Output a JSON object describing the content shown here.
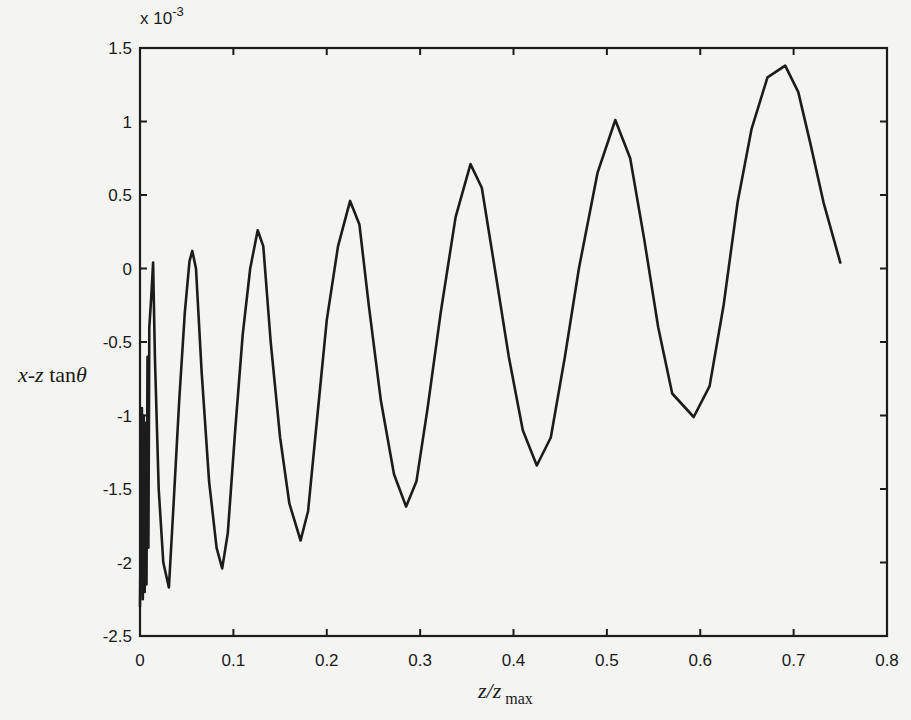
{
  "chart_data": {
    "type": "line",
    "title": "",
    "xlabel": "z/z max",
    "xlabel_parts": {
      "main": "z/z",
      "sub": "max"
    },
    "ylabel": "x-z tanθ",
    "ylabel_parts": {
      "italic": "x-z",
      "roman": " tan",
      "theta": "θ"
    },
    "y_multiplier": "x 10",
    "y_multiplier_exp": "-3",
    "xlim": [
      0,
      0.8
    ],
    "ylim": [
      -2.5,
      1.5
    ],
    "xticks": [
      "0",
      "0.1",
      "0.2",
      "0.3",
      "0.4",
      "0.5",
      "0.6",
      "0.7",
      "0.8"
    ],
    "xtick_values": [
      0,
      0.1,
      0.2,
      0.3,
      0.4,
      0.5,
      0.6,
      0.7,
      0.8
    ],
    "yticks": [
      "1.5",
      "1",
      "0.5",
      "0",
      "-0.5",
      "-1",
      "-1.5",
      "-2",
      "-2.5"
    ],
    "ytick_values": [
      1.5,
      1,
      0.5,
      0,
      -0.5,
      -1,
      -1.5,
      -2,
      -2.5
    ],
    "grid": false,
    "legend": "none",
    "line_color": "#1c1c1c",
    "series": [
      {
        "name": "x-z tanθ",
        "x": [
          0.0,
          0.002,
          0.003,
          0.004,
          0.005,
          0.006,
          0.007,
          0.008,
          0.009,
          0.01,
          0.012,
          0.014,
          0.016,
          0.02,
          0.025,
          0.031,
          0.036,
          0.042,
          0.048,
          0.053,
          0.056,
          0.06,
          0.066,
          0.074,
          0.082,
          0.088,
          0.094,
          0.102,
          0.11,
          0.118,
          0.126,
          0.132,
          0.14,
          0.15,
          0.16,
          0.172,
          0.18,
          0.19,
          0.2,
          0.212,
          0.225,
          0.235,
          0.245,
          0.258,
          0.272,
          0.285,
          0.296,
          0.308,
          0.322,
          0.338,
          0.354,
          0.366,
          0.38,
          0.395,
          0.41,
          0.425,
          0.44,
          0.455,
          0.47,
          0.49,
          0.509,
          0.525,
          0.54,
          0.555,
          0.57,
          0.593,
          0.61,
          0.625,
          0.64,
          0.655,
          0.672,
          0.691,
          0.705,
          0.718,
          0.732,
          0.75
        ],
        "values": [
          -2.3,
          -0.95,
          -2.25,
          -1.0,
          -2.2,
          -1.05,
          -2.15,
          -0.6,
          -1.9,
          -0.4,
          -0.2,
          0.04,
          -0.6,
          -1.5,
          -2.0,
          -2.17,
          -1.6,
          -0.9,
          -0.3,
          0.05,
          0.12,
          0.0,
          -0.7,
          -1.45,
          -1.9,
          -2.04,
          -1.8,
          -1.1,
          -0.45,
          0.0,
          0.26,
          0.15,
          -0.5,
          -1.15,
          -1.6,
          -1.85,
          -1.65,
          -1.0,
          -0.35,
          0.15,
          0.46,
          0.3,
          -0.25,
          -0.9,
          -1.4,
          -1.62,
          -1.45,
          -0.95,
          -0.3,
          0.35,
          0.71,
          0.55,
          0.0,
          -0.6,
          -1.1,
          -1.34,
          -1.15,
          -0.6,
          0.0,
          0.65,
          1.01,
          0.75,
          0.2,
          -0.4,
          -0.85,
          -1.01,
          -0.8,
          -0.25,
          0.45,
          0.95,
          1.3,
          1.38,
          1.2,
          0.85,
          0.45,
          0.04
        ]
      }
    ]
  }
}
